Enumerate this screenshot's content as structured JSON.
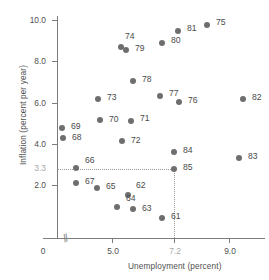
{
  "chart_data": {
    "type": "scatter",
    "title": "",
    "xlabel": "Unemployment (percent)",
    "ylabel": "Inflation (percent per year)",
    "xlim": [
      0,
      9.9
    ],
    "ylim": [
      0,
      10.7
    ],
    "xticks": [
      "0",
      "5.0",
      "7.2",
      "9.0"
    ],
    "xtick_values": [
      0,
      5.0,
      7.2,
      9.0
    ],
    "yticks": [
      "2.0",
      "4.0",
      "6.0",
      "8.0",
      "10.0"
    ],
    "ytick_values": [
      2.0,
      4.0,
      6.0,
      8.0,
      10.0
    ],
    "highlight_ytick": "3.3",
    "highlight_ytick_value": 3.3,
    "highlight_xtick": "7.2",
    "highlight_xtick_value": 7.2,
    "grid": false,
    "legend": null,
    "axis_break": true,
    "guides": {
      "horizontal_at_y": 3.3,
      "vertical_at_x": 7.2,
      "style": "dotted"
    },
    "point_labels": [
      "61",
      "62",
      "63",
      "64",
      "65",
      "66",
      "67",
      "68",
      "69",
      "70",
      "71",
      "72",
      "73",
      "74",
      "75",
      "76",
      "77",
      "78",
      "79",
      "80",
      "81",
      "82",
      "83",
      "84",
      "85"
    ],
    "points": [
      {
        "label": "61",
        "x": 6.7,
        "y": 0.8,
        "px": 162,
        "py": 218,
        "lx": 9,
        "ly": -3
      },
      {
        "label": "62",
        "x": 5.6,
        "y": 2.3,
        "px": 128,
        "py": 195,
        "lx": 8,
        "ly": -11
      },
      {
        "label": "63",
        "x": 5.7,
        "y": 1.4,
        "px": 133,
        "py": 209,
        "lx": 9,
        "ly": -2
      },
      {
        "label": "64",
        "x": 5.2,
        "y": 1.6,
        "px": 117,
        "py": 207,
        "lx": 9,
        "ly": -10
      },
      {
        "label": "65",
        "x": 4.5,
        "y": 2.5,
        "px": 97,
        "py": 188,
        "lx": 9,
        "ly": -3
      },
      {
        "label": "66",
        "x": 3.8,
        "y": 3.3,
        "px": 76,
        "py": 168,
        "lx": 9,
        "ly": -9
      },
      {
        "label": "67",
        "x": 3.8,
        "y": 2.6,
        "px": 76,
        "py": 183,
        "lx": 9,
        "ly": -3
      },
      {
        "label": "68",
        "x": 3.6,
        "y": 4.8,
        "px": 63,
        "py": 138,
        "lx": 9,
        "ly": -2
      },
      {
        "label": "69",
        "x": 3.5,
        "y": 5.2,
        "px": 62,
        "py": 128,
        "lx": 9,
        "ly": -3
      },
      {
        "label": "70",
        "x": 4.9,
        "y": 5.6,
        "px": 100,
        "py": 120,
        "lx": 9,
        "ly": -2
      },
      {
        "label": "71",
        "x": 5.9,
        "y": 5.5,
        "px": 131,
        "py": 121,
        "lx": 9,
        "ly": -4
      },
      {
        "label": "72",
        "x": 5.6,
        "y": 4.7,
        "px": 122,
        "py": 141,
        "lx": 9,
        "ly": -2
      },
      {
        "label": "73",
        "x": 4.9,
        "y": 6.4,
        "px": 98,
        "py": 99,
        "lx": 9,
        "ly": -3
      },
      {
        "label": "74",
        "x": 5.6,
        "y": 8.8,
        "px": 121,
        "py": 47,
        "lx": 4,
        "ly": -12
      },
      {
        "label": "75",
        "x": 8.3,
        "y": 9.9,
        "px": 207,
        "py": 25,
        "lx": 9,
        "ly": -4
      },
      {
        "label": "76",
        "x": 7.6,
        "y": 6.3,
        "px": 179,
        "py": 102,
        "lx": 9,
        "ly": -3
      },
      {
        "label": "77",
        "x": 6.9,
        "y": 6.6,
        "px": 160,
        "py": 96,
        "lx": 9,
        "ly": -4
      },
      {
        "label": "78",
        "x": 6.0,
        "y": 7.3,
        "px": 133,
        "py": 81,
        "lx": 9,
        "ly": -3
      },
      {
        "label": "79",
        "x": 5.8,
        "y": 8.6,
        "px": 126,
        "py": 50,
        "lx": 9,
        "ly": -3
      },
      {
        "label": "80",
        "x": 7.1,
        "y": 9.1,
        "px": 162,
        "py": 43,
        "lx": 9,
        "ly": -4
      },
      {
        "label": "81",
        "x": 7.6,
        "y": 9.6,
        "px": 178,
        "py": 31,
        "lx": 9,
        "ly": -4
      },
      {
        "label": "82",
        "x": 9.7,
        "y": 6.4,
        "px": 243,
        "py": 99,
        "lx": 9,
        "ly": -3
      },
      {
        "label": "83",
        "x": 9.6,
        "y": 3.8,
        "px": 239,
        "py": 158,
        "lx": 9,
        "ly": -3
      },
      {
        "label": "84",
        "x": 7.2,
        "y": 4.1,
        "px": 174,
        "py": 152,
        "lx": 9,
        "ly": -3
      },
      {
        "label": "85",
        "x": 7.2,
        "y": 3.3,
        "px": 174,
        "py": 169,
        "lx": 9,
        "ly": -3
      }
    ]
  },
  "axes": {
    "x_title": "Unemployment (percent)",
    "y_title": "Inflation (percent per year)",
    "break_symbol": "//"
  }
}
